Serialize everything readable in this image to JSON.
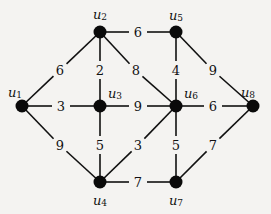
{
  "graph": {
    "nodes": [
      {
        "id": "u1",
        "label": "u",
        "sub": "1",
        "x": 22,
        "y": 106,
        "lx": 15,
        "ly": 92
      },
      {
        "id": "u2",
        "label": "u",
        "sub": "2",
        "x": 100,
        "y": 32,
        "lx": 100,
        "ly": 14
      },
      {
        "id": "u3",
        "label": "u",
        "sub": "3",
        "x": 100,
        "y": 106,
        "lx": 115,
        "ly": 93
      },
      {
        "id": "u4",
        "label": "u",
        "sub": "4",
        "x": 100,
        "y": 182,
        "lx": 100,
        "ly": 200
      },
      {
        "id": "u5",
        "label": "u",
        "sub": "5",
        "x": 176,
        "y": 32,
        "lx": 176,
        "ly": 15
      },
      {
        "id": "u6",
        "label": "u",
        "sub": "6",
        "x": 176,
        "y": 106,
        "lx": 191,
        "ly": 93
      },
      {
        "id": "u7",
        "label": "u",
        "sub": "7",
        "x": 176,
        "y": 182,
        "lx": 176,
        "ly": 200
      },
      {
        "id": "u8",
        "label": "u",
        "sub": "8",
        "x": 253,
        "y": 106,
        "lx": 248,
        "ly": 92
      }
    ],
    "edges": [
      {
        "from": "u1",
        "to": "u2",
        "weight": "6",
        "wx": 60,
        "wy": 70
      },
      {
        "from": "u1",
        "to": "u3",
        "weight": "3",
        "wx": 61,
        "wy": 106
      },
      {
        "from": "u1",
        "to": "u4",
        "weight": "9",
        "wx": 60,
        "wy": 145
      },
      {
        "from": "u2",
        "to": "u3",
        "weight": "2",
        "wx": 100,
        "wy": 70
      },
      {
        "from": "u2",
        "to": "u5",
        "weight": "6",
        "wx": 138,
        "wy": 32
      },
      {
        "from": "u2",
        "to": "u6",
        "weight": "8",
        "wx": 136,
        "wy": 70
      },
      {
        "from": "u3",
        "to": "u6",
        "weight": "9",
        "wx": 138,
        "wy": 106
      },
      {
        "from": "u3",
        "to": "u4",
        "weight": "5",
        "wx": 100,
        "wy": 145
      },
      {
        "from": "u4",
        "to": "u6",
        "weight": "3",
        "wx": 138,
        "wy": 145
      },
      {
        "from": "u4",
        "to": "u7",
        "weight": "7",
        "wx": 138,
        "wy": 182
      },
      {
        "from": "u5",
        "to": "u6",
        "weight": "4",
        "wx": 176,
        "wy": 70
      },
      {
        "from": "u5",
        "to": "u8",
        "weight": "9",
        "wx": 213,
        "wy": 70
      },
      {
        "from": "u6",
        "to": "u8",
        "weight": "6",
        "wx": 213,
        "wy": 106
      },
      {
        "from": "u6",
        "to": "u7",
        "weight": "5",
        "wx": 176,
        "wy": 145
      },
      {
        "from": "u7",
        "to": "u8",
        "weight": "7",
        "wx": 213,
        "wy": 145
      }
    ]
  }
}
